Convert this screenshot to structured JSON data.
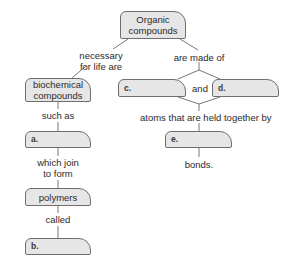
{
  "diagram": {
    "type": "concept-map",
    "nodes": {
      "organic": "Organic compounds",
      "organic_line1": "Organic",
      "organic_line2": "compounds",
      "biochemical_line1": "biochemical",
      "biochemical_line2": "compounds",
      "polymers": "polymers",
      "blank_a": "a.",
      "blank_b": "b.",
      "blank_c": "c.",
      "blank_d": "d.",
      "blank_e": "e."
    },
    "links": {
      "necessary_line1": "necessary",
      "necessary_line2": "for life are",
      "made_of": "are made of",
      "and": "and",
      "such_as": "such as",
      "atoms_held": "atoms that are held together by",
      "which_join_line1": "which join",
      "which_join_line2": "to form",
      "bonds": "bonds.",
      "called": "called"
    },
    "colors": {
      "box_fill": "#e6e6e6",
      "box_border": "#6e6e6e",
      "line": "#555555",
      "text": "#2b2b2b"
    }
  }
}
